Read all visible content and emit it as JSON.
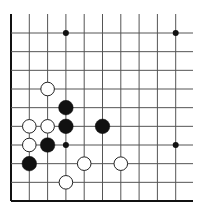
{
  "diagram": {
    "type": "go-board-corner",
    "columns": 10,
    "rows": 10,
    "colors": {
      "background": "#ffffff",
      "line": "#555555",
      "edge": "#111111",
      "black_stone": "#111111",
      "white_stone_fill": "#ffffff",
      "white_stone_stroke": "#222222"
    },
    "star_points": [
      {
        "col": 3,
        "row": 0
      },
      {
        "col": 9,
        "row": 0
      },
      {
        "col": 3,
        "row": 6
      },
      {
        "col": 9,
        "row": 6
      }
    ],
    "stones": [
      {
        "color": "white",
        "col": 2,
        "row": 3
      },
      {
        "color": "black",
        "col": 3,
        "row": 4
      },
      {
        "color": "white",
        "col": 1,
        "row": 5
      },
      {
        "color": "white",
        "col": 2,
        "row": 5
      },
      {
        "color": "black",
        "col": 3,
        "row": 5
      },
      {
        "color": "black",
        "col": 5,
        "row": 5
      },
      {
        "color": "white",
        "col": 1,
        "row": 6
      },
      {
        "color": "black",
        "col": 2,
        "row": 6
      },
      {
        "color": "black",
        "col": 1,
        "row": 7
      },
      {
        "color": "white",
        "col": 4,
        "row": 7
      },
      {
        "color": "white",
        "col": 6,
        "row": 7
      },
      {
        "color": "white",
        "col": 3,
        "row": 8
      }
    ]
  }
}
